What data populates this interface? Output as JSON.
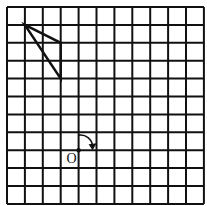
{
  "diagram": {
    "grid": {
      "cols": 11,
      "rows": 11,
      "origin_x": 7,
      "origin_y": 7,
      "cell": 17.9,
      "line_color": "#111111"
    },
    "triangle": {
      "points": [
        [
          1,
          1
        ],
        [
          3,
          2
        ],
        [
          3,
          4
        ]
      ],
      "stroke": "#111111"
    },
    "center_point": {
      "label": "O",
      "col": 4,
      "row": 8
    },
    "rotation_arrow": {
      "direction": "clockwise"
    },
    "caption": "(cut off)"
  }
}
